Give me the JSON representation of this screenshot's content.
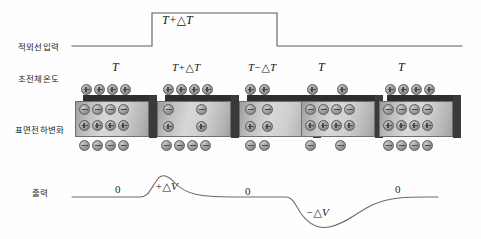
{
  "figure": {
    "rows": [
      {
        "id": "ir-input",
        "label": "적외선입력"
      },
      {
        "id": "pyro-temp",
        "label": "초전체온도"
      },
      {
        "id": "surface-charge",
        "label": "표면전하변화"
      },
      {
        "id": "output",
        "label": "출력"
      }
    ]
  },
  "ir_input": {
    "pulse_label": "T+△T",
    "baseline_level": "low",
    "pulse_start_x": 152,
    "pulse_end_x": 277
  },
  "stages": [
    {
      "index": 1,
      "temp_label": "T",
      "temp_plain": "T",
      "outer_top_count": 4,
      "inner_minus_count": 4,
      "inner_plus_count": 4,
      "outer_bottom_count": 4,
      "spread": "dense"
    },
    {
      "index": 2,
      "temp_label": "T+△T",
      "temp_plain": "T+dT",
      "outer_top_count": 4,
      "inner_minus_count": 2,
      "inner_plus_count": 2,
      "outer_bottom_count": 4,
      "spread": "sparse"
    },
    {
      "index": 3,
      "temp_label": "T−△T",
      "temp_plain": "T-dT",
      "outer_top_count": 2,
      "inner_minus_count": 2,
      "inner_plus_count": 2,
      "outer_bottom_count": 2,
      "spread": "sparse"
    },
    {
      "index": 4,
      "temp_label": "T",
      "temp_plain": "T",
      "outer_top_count": 2,
      "inner_minus_count": 4,
      "inner_plus_count": 4,
      "outer_bottom_count": 2,
      "spread": "dense"
    },
    {
      "index": 5,
      "temp_label": "T",
      "temp_plain": "T",
      "outer_top_count": 4,
      "inner_minus_count": 4,
      "inner_plus_count": 4,
      "outer_bottom_count": 4,
      "spread": "dense"
    }
  ],
  "output_curve": {
    "annotations": [
      {
        "id": "zero-1",
        "text": "0",
        "x": 119,
        "y": 190
      },
      {
        "id": "pos-peak",
        "text": "+△V",
        "x": 161,
        "y": 186
      },
      {
        "id": "zero-2",
        "text": "0",
        "x": 248,
        "y": 192
      },
      {
        "id": "neg-peak",
        "text": "−△V",
        "x": 316,
        "y": 213
      },
      {
        "id": "zero-3",
        "text": "0",
        "x": 398,
        "y": 190
      }
    ],
    "baseline_y": 197,
    "positive_peak": {
      "x": 157,
      "y": 178
    },
    "negative_peak": {
      "x": 327,
      "y": 226
    }
  },
  "charge_symbols": {
    "plus": "+",
    "minus": "−"
  },
  "colors": {
    "ink": "#1b1b1b",
    "line": "#5a5a5a",
    "block_top": "#2e2e2e",
    "block_face_light": "#d7d7d7",
    "block_face_dark": "#9c9c9c",
    "token_fill": "#a8a8a8",
    "background": "#ffffff"
  }
}
